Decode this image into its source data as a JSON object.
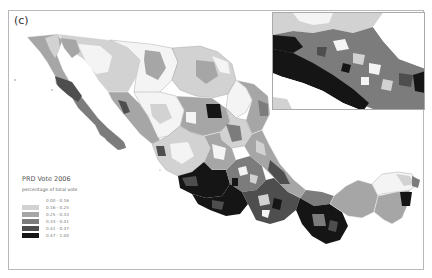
{
  "figure": {
    "panel_label": "(c)"
  },
  "legend": {
    "title": "PRD Vote 2006",
    "subtitle": "percentage of total vote",
    "classes": [
      {
        "label": "0.00 - 0.16",
        "color": "#f4f4f4"
      },
      {
        "label": "0.16 - 0.25",
        "color": "#d2d2d2"
      },
      {
        "label": "0.25 - 0.33",
        "color": "#a6a6a6"
      },
      {
        "label": "0.33 - 0.41",
        "color": "#7c7c7c"
      },
      {
        "label": "0.41 - 0.47",
        "color": "#4e4e4e"
      },
      {
        "label": "0.47 - 1.00",
        "color": "#151515"
      }
    ]
  },
  "map": {
    "subject": "Mexico municipalities",
    "inset": "Enlarged view of central/southern Mexico"
  }
}
